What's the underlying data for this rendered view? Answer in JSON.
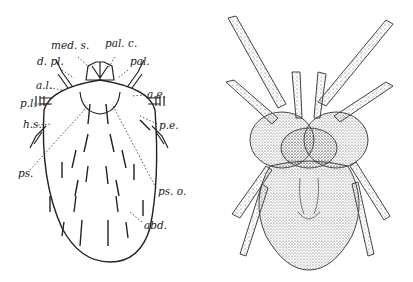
{
  "figure": {
    "left_panel": {
      "type": "labeled line diagram (dorsal view)",
      "labels": [
        {
          "text": "med. s.",
          "x": 51,
          "y": 47
        },
        {
          "text": "pal. c.",
          "x": 105,
          "y": 45
        },
        {
          "text": "d. pl.",
          "x": 37,
          "y": 63
        },
        {
          "text": "pal.",
          "x": 130,
          "y": 63
        },
        {
          "text": "a.l.",
          "x": 36,
          "y": 84
        },
        {
          "text": "a.e.",
          "x": 147,
          "y": 91
        },
        {
          "text": "p.l.",
          "x": 20,
          "y": 101
        },
        {
          "text": "h.s.",
          "x": 23,
          "y": 121
        },
        {
          "text": "p.e.",
          "x": 159,
          "y": 121
        },
        {
          "text": "ps.",
          "x": 18,
          "y": 172
        },
        {
          "text": "ps. o.",
          "x": 158,
          "y": 188
        },
        {
          "text": "abd.",
          "x": 144,
          "y": 222
        }
      ]
    },
    "right_panel": {
      "type": "stippled illustration (dorsal view)"
    }
  }
}
